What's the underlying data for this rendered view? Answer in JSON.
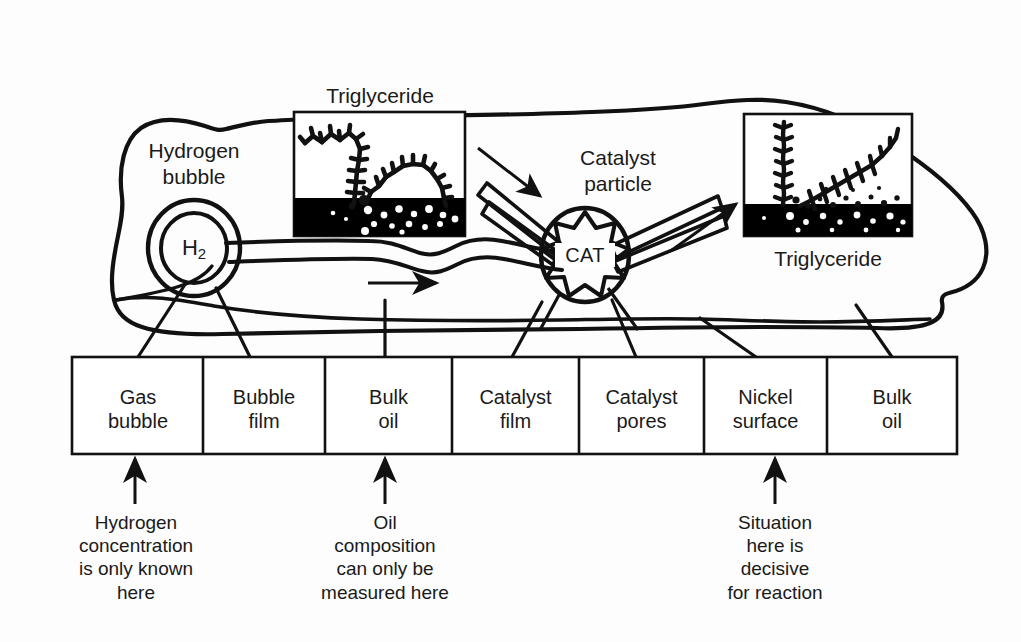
{
  "figure": {
    "type": "process-schematic"
  },
  "drawing": {
    "hydrogen_bubble_label": "Hydrogen\nbubble",
    "hydrogen_bubble_species_main": "H",
    "hydrogen_bubble_species_sub": "2",
    "catalyst_label": "Catalyst\nparticle",
    "catalyst_core_text": "CAT",
    "inset_left_label": "Triglyceride",
    "inset_right_label": "Triglyceride"
  },
  "zones": {
    "headers": [
      "Gas\nbubble",
      "Bubble\nfilm",
      "Bulk\noil",
      "Catalyst\nfilm",
      "Catalyst\npores",
      "Nickel\nsurface",
      "Bulk\noil"
    ]
  },
  "captions": [
    "Hydrogen\nconcentration\nis only known\nhere",
    "Oil\ncomposition\ncan only be\nmeasured here",
    "Situation\nhere is\ndecisive\nfor reaction"
  ],
  "colors": {
    "ink": "#111111",
    "paper": "#fdfdfd",
    "inset_oil_band": "#000000",
    "inset_background": "#ffffff"
  }
}
